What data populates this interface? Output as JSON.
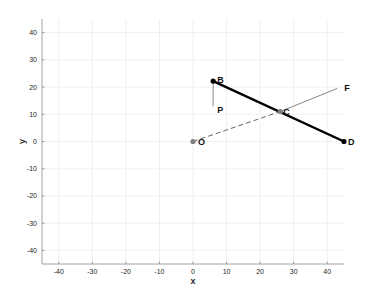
{
  "chart_data": {
    "type": "line",
    "title": "",
    "xlabel": "x",
    "ylabel": "y",
    "xlim": [
      -45,
      45
    ],
    "ylim": [
      -45,
      45
    ],
    "grid": true,
    "xticks": [
      -40,
      -30,
      -20,
      -10,
      0,
      10,
      20,
      30,
      40
    ],
    "yticks": [
      -40,
      -30,
      -20,
      -10,
      0,
      10,
      20,
      30,
      40
    ],
    "points": [
      {
        "name": "O",
        "label": "O",
        "x": 0,
        "y": 0,
        "color": "#808080"
      },
      {
        "name": "B",
        "label": "B",
        "x": 6,
        "y": 22.2,
        "color": "#000000"
      },
      {
        "name": "D",
        "label": "D",
        "x": 45,
        "y": 0,
        "color": "#000000"
      },
      {
        "name": "C",
        "label": "C",
        "x": 26,
        "y": 11,
        "color": "#808080"
      },
      {
        "name": "P",
        "label": "P",
        "x": 6,
        "y": 13,
        "color": null
      },
      {
        "name": "F",
        "label": "F",
        "x": 43,
        "y": 19.5,
        "color": null
      }
    ],
    "series": [
      {
        "name": "segment-BD",
        "from": "B",
        "to": "D",
        "style": "solid",
        "color": "#000000",
        "weight": "thick"
      },
      {
        "name": "segment-OC",
        "from": "O",
        "to": "C",
        "style": "dashed",
        "color": "#555555",
        "weight": "thin"
      },
      {
        "name": "ray-CF",
        "from": "C",
        "to": "F",
        "style": "solid",
        "color": "#777777",
        "weight": "thin"
      },
      {
        "name": "segment-BP",
        "from": "B",
        "to": "P",
        "style": "solid",
        "color": "#777777",
        "weight": "thin"
      }
    ]
  }
}
